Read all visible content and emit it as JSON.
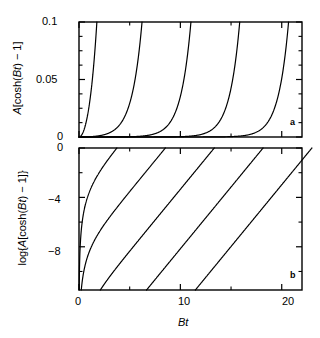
{
  "figure": {
    "xlabel": "Bt",
    "panel_a_tag": "a",
    "panel_b_tag": "b",
    "panel_a_ylabel_prefix": "A",
    "panel_a_ylabel_body": "[cosh(",
    "panel_a_ylabel_var": "Bt",
    "panel_a_ylabel_suffix": ") − 1]",
    "panel_b_ylabel_prefix": "log{",
    "panel_b_ylabel_a": "A",
    "panel_b_ylabel_body": "[cosh(",
    "panel_b_ylabel_var": "Bt",
    "panel_b_ylabel_suffix": ") − 1]}",
    "a_ytick_0": "0",
    "a_ytick_1": "0.05",
    "a_ytick_2": "0.1",
    "b_ytick_0": "0",
    "b_ytick_1": "−4",
    "b_ytick_2": "−8",
    "xtick_0": "0",
    "xtick_1": "10",
    "xtick_2": "20",
    "line_color": "#000000",
    "axis_color": "#000000"
  },
  "chart_data": [
    {
      "type": "line",
      "panel": "a",
      "title": "",
      "xlabel": "Bt",
      "ylabel": "A[cosh(Bt) - 1]",
      "xlim": [
        0,
        22
      ],
      "ylim": [
        0,
        0.1
      ],
      "xticks": [
        0,
        10,
        20
      ],
      "xticks_minor": [
        5,
        15
      ],
      "yticks": [
        0,
        0.05,
        0.1
      ],
      "yticks_minor": [
        0.0125,
        0.025,
        0.0375,
        0.0625,
        0.075,
        0.0875
      ],
      "grid": false,
      "legend": false,
      "series": [
        {
          "name": "A = 5.0e-2",
          "A": 0.05,
          "reach_x": 1.54
        },
        {
          "name": "A = 4.0e-4",
          "A": 0.0004,
          "reach_x": 6.41
        },
        {
          "name": "A = 3.2e-6",
          "A": 3.2e-06,
          "reach_x": 11.28
        },
        {
          "name": "A = 2.6e-8",
          "A": 2.6e-08,
          "reach_x": 16.15
        },
        {
          "name": "A = 2.1e-10",
          "A": 2.1e-10,
          "reach_x": 21.02
        }
      ],
      "note": "Each curve is y = A[cosh(Bt) - 1], clipped at y = 0.1"
    },
    {
      "type": "line",
      "panel": "b",
      "title": "",
      "xlabel": "Bt",
      "ylabel": "log{A[cosh(Bt) - 1]}",
      "xlim": [
        0,
        22
      ],
      "ylim": [
        -11.5,
        0
      ],
      "xticks": [
        0,
        10,
        20
      ],
      "xticks_minor": [
        5,
        15
      ],
      "yticks": [
        0,
        -4,
        -8
      ],
      "yticks_minor": [
        -2,
        -6,
        -10
      ],
      "grid": false,
      "legend": false,
      "series": [
        {
          "name": "A = 5.0e-2",
          "A": 0.05,
          "reach_x": 1.54
        },
        {
          "name": "A = 4.0e-4",
          "A": 0.0004,
          "reach_x": 6.41
        },
        {
          "name": "A = 3.2e-6",
          "A": 3.2e-06,
          "reach_x": 11.28
        },
        {
          "name": "A = 2.6e-8",
          "A": 2.6e-08,
          "reach_x": 16.15
        },
        {
          "name": "A = 2.1e-10",
          "A": 2.1e-10,
          "reach_x": 21.02
        }
      ],
      "note": "Natural log of the panel-a curves; each saturates to a line of slope 1 after Bt>2"
    }
  ]
}
